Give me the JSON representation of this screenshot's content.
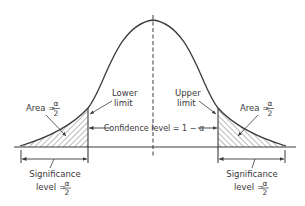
{
  "diagram": {
    "type": "normal-distribution-confidence-interval",
    "labels": {
      "lower_limit_line1": "Lower",
      "lower_limit_line2": "limit",
      "upper_limit_line1": "Upper",
      "upper_limit_line2": "limit",
      "area_left_prefix": "Area =",
      "area_right_prefix": "Area =",
      "alpha_symbol": "α",
      "denominator": "2",
      "confidence_level": "Confidence level = 1 − α",
      "significance_left_line1": "Significance",
      "significance_left_prefix": "level =",
      "significance_right_line1": "Significance",
      "significance_right_prefix": "level ="
    },
    "colors": {
      "stroke": "#3a3a3a",
      "hatch": "#555555",
      "background": "#ffffff"
    }
  }
}
